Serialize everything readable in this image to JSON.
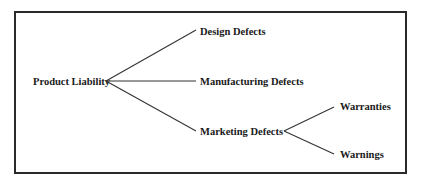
{
  "diagram": {
    "type": "tree",
    "root": {
      "label": "Product Liability",
      "children": [
        {
          "label": "Design Defects",
          "children": []
        },
        {
          "label": "Manufacturing Defects",
          "children": []
        },
        {
          "label": "Marketing Defects",
          "children": [
            {
              "label": "Warranties",
              "children": []
            },
            {
              "label": "Warnings",
              "children": []
            }
          ]
        }
      ]
    },
    "colors": {
      "text": "#1a1a1a",
      "lines": "#333333",
      "frame": "#2a2a2a",
      "background": "#ffffff"
    }
  }
}
